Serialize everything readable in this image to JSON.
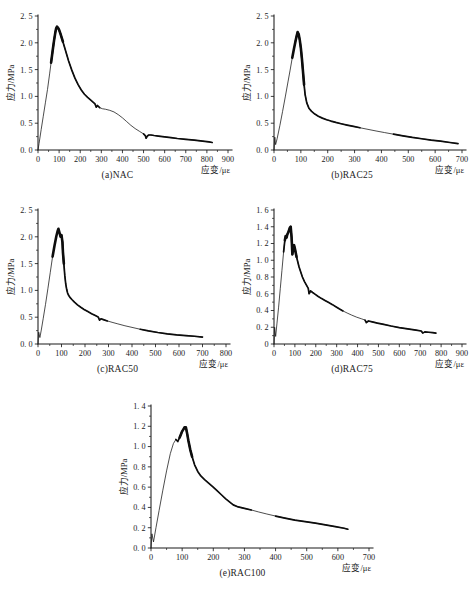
{
  "figure": {
    "axis_labels": {
      "y": "应力/MPa",
      "x": "应变/με"
    }
  },
  "panels": [
    {
      "id": "nac",
      "caption": "(a)NAC",
      "x_ticks": [
        "0",
        "100",
        "200",
        "300",
        "400",
        "500",
        "600",
        "700",
        "800",
        "900"
      ],
      "y_ticks": [
        "0. 0",
        "0. 5",
        "1. 0",
        "1. 5",
        "2. 0",
        "2. 5"
      ],
      "ylabel": "应力/MPa",
      "xlabel": "应变/με"
    },
    {
      "id": "rac25",
      "caption": "(b)RAC25",
      "x_ticks": [
        "0",
        "100",
        "200",
        "300",
        "400",
        "500",
        "600",
        "700"
      ],
      "y_ticks": [
        "0. 0",
        "0. 5",
        "1. 0",
        "1. 5",
        "2. 0",
        "2. 5"
      ],
      "ylabel": "应力/MPa",
      "xlabel": "应变/με"
    },
    {
      "id": "rac50",
      "caption": "(c)RAC50",
      "x_ticks": [
        "0",
        "100",
        "200",
        "300",
        "400",
        "500",
        "600",
        "700",
        "800"
      ],
      "y_ticks": [
        "0. 0",
        "0. 5",
        "1. 0",
        "1. 5",
        "2. 0",
        "2. 5"
      ],
      "ylabel": "应力/MPa",
      "xlabel": "应变/με"
    },
    {
      "id": "rac75",
      "caption": "(d)RAC75",
      "x_ticks": [
        "0",
        "100",
        "200",
        "300",
        "400",
        "500",
        "600",
        "700",
        "800",
        "900"
      ],
      "y_ticks": [
        "0",
        "0. 2",
        "0. 4",
        "0. 6",
        "0. 8",
        "1. 0",
        "1. 2",
        "1. 4",
        "1. 6"
      ],
      "ylabel": "应力/MPa",
      "xlabel": "应变/με"
    },
    {
      "id": "rac100",
      "caption": "(e)RAC100",
      "x_ticks": [
        "0",
        "100",
        "200",
        "300",
        "400",
        "500",
        "600",
        "700"
      ],
      "y_ticks": [
        "0. 0",
        "0. 2",
        "0. 4",
        "0. 6",
        "0. 8",
        "1. 0",
        "1. 2",
        "1. 4"
      ],
      "ylabel": "应力/MPa",
      "xlabel": "应变/με"
    }
  ],
  "chart_data": [
    {
      "type": "line",
      "id": "nac",
      "title": "(a)NAC",
      "xlabel": "应变/με",
      "ylabel": "应力/MPa",
      "xlim": [
        0,
        900
      ],
      "ylim": [
        0,
        2.5
      ],
      "xtick_step": 100,
      "ytick_step": 0.5,
      "grid": false,
      "legend": "none",
      "peak": {
        "x": 88,
        "y": 2.3
      },
      "series": [
        {
          "name": "NAC stress-strain",
          "x": [
            0,
            5,
            15,
            25,
            35,
            45,
            55,
            62,
            70,
            76,
            82,
            86,
            90,
            95,
            100,
            108,
            118,
            130,
            145,
            160,
            175,
            190,
            205,
            220,
            235,
            250,
            262,
            270,
            276,
            282,
            292,
            305,
            320,
            340,
            360,
            380,
            400,
            420,
            440,
            460,
            480,
            500,
            508,
            512,
            518,
            525,
            535,
            550,
            570,
            600,
            630,
            660,
            700,
            740,
            780,
            810,
            825
          ],
          "y": [
            0.0,
            0.12,
            0.38,
            0.63,
            0.88,
            1.13,
            1.42,
            1.63,
            1.87,
            2.04,
            2.19,
            2.27,
            2.3,
            2.28,
            2.24,
            2.15,
            2.02,
            1.86,
            1.66,
            1.49,
            1.34,
            1.22,
            1.12,
            1.04,
            0.98,
            0.93,
            0.89,
            0.86,
            0.8,
            0.83,
            0.79,
            0.77,
            0.76,
            0.74,
            0.71,
            0.66,
            0.6,
            0.53,
            0.46,
            0.4,
            0.35,
            0.3,
            0.27,
            0.22,
            0.26,
            0.28,
            0.28,
            0.27,
            0.26,
            0.245,
            0.23,
            0.215,
            0.2,
            0.185,
            0.165,
            0.15,
            0.14
          ]
        }
      ]
    },
    {
      "type": "line",
      "id": "rac25",
      "title": "(b)RAC25",
      "xlabel": "应变/με",
      "ylabel": "应力/MPa",
      "xlim": [
        0,
        700
      ],
      "ylim": [
        0,
        2.5
      ],
      "xtick_step": 100,
      "ytick_step": 0.5,
      "grid": false,
      "legend": "none",
      "peak": {
        "x": 88,
        "y": 2.2
      },
      "series": [
        {
          "name": "RAC25 stress-strain",
          "x": [
            0,
            3,
            6,
            12,
            22,
            32,
            42,
            52,
            60,
            68,
            74,
            80,
            84,
            88,
            92,
            96,
            100,
            104,
            108,
            112,
            116,
            122,
            130,
            140,
            152,
            165,
            180,
            196,
            212,
            230,
            250,
            272,
            296,
            320,
            350,
            380,
            412,
            445,
            480,
            515,
            550,
            585,
            620,
            655,
            685
          ],
          "y": [
            0.0,
            0.24,
            0.1,
            0.22,
            0.46,
            0.72,
            0.99,
            1.27,
            1.49,
            1.72,
            1.88,
            2.03,
            2.12,
            2.2,
            2.16,
            2.05,
            1.9,
            1.7,
            1.46,
            1.22,
            1.03,
            0.88,
            0.78,
            0.72,
            0.67,
            0.63,
            0.595,
            0.565,
            0.54,
            0.515,
            0.49,
            0.465,
            0.44,
            0.415,
            0.385,
            0.355,
            0.325,
            0.295,
            0.265,
            0.235,
            0.21,
            0.185,
            0.165,
            0.14,
            0.12
          ]
        }
      ]
    },
    {
      "type": "line",
      "id": "rac50",
      "title": "(c)RAC50",
      "xlabel": "应变/με",
      "ylabel": "应力/MPa",
      "xlim": [
        0,
        800
      ],
      "ylim": [
        0,
        2.5
      ],
      "xtick_step": 100,
      "ytick_step": 0.5,
      "grid": false,
      "legend": "none",
      "peak": {
        "x": 85,
        "y": 2.15
      },
      "series": [
        {
          "name": "RAC50 stress-strain",
          "x": [
            0,
            3,
            8,
            14,
            22,
            32,
            42,
            52,
            62,
            70,
            78,
            83,
            87,
            92,
            96,
            100,
            104,
            106,
            110,
            114,
            118,
            122,
            126,
            130,
            136,
            144,
            155,
            168,
            182,
            196,
            212,
            228,
            244,
            256,
            262,
            268,
            278,
            295,
            315,
            340,
            370,
            400,
            435,
            470,
            510,
            550,
            590,
            630,
            665,
            700
          ],
          "y": [
            0.0,
            0.22,
            0.12,
            0.26,
            0.47,
            0.74,
            1.03,
            1.33,
            1.63,
            1.83,
            2.01,
            2.1,
            2.15,
            2.07,
            2.0,
            2.03,
            1.9,
            1.72,
            1.5,
            1.28,
            1.12,
            1.02,
            0.95,
            0.91,
            0.87,
            0.83,
            0.78,
            0.73,
            0.685,
            0.645,
            0.605,
            0.565,
            0.53,
            0.505,
            0.445,
            0.47,
            0.455,
            0.43,
            0.405,
            0.375,
            0.34,
            0.31,
            0.275,
            0.245,
            0.215,
            0.19,
            0.17,
            0.155,
            0.145,
            0.13
          ]
        }
      ]
    },
    {
      "type": "line",
      "id": "rac75",
      "title": "(d)RAC75",
      "xlabel": "应变/με",
      "ylabel": "应力/MPa",
      "xlim": [
        0,
        900
      ],
      "ylim": [
        0,
        1.6
      ],
      "xtick_step": 100,
      "ytick_step": 0.2,
      "grid": false,
      "legend": "none",
      "peak": {
        "x": 78,
        "y": 1.4
      },
      "series": [
        {
          "name": "RAC75 stress-strain",
          "x": [
            0,
            3,
            8,
            14,
            22,
            30,
            38,
            46,
            52,
            56,
            60,
            64,
            68,
            72,
            76,
            80,
            84,
            88,
            92,
            96,
            100,
            104,
            108,
            114,
            120,
            128,
            136,
            146,
            156,
            164,
            168,
            175,
            185,
            196,
            210,
            226,
            244,
            262,
            280,
            296,
            312,
            330,
            350,
            372,
            396,
            420,
            436,
            442,
            452,
            470,
            495,
            525,
            560,
            600,
            640,
            680,
            705,
            712,
            722,
            740,
            760,
            775
          ],
          "y": [
            0.0,
            0.2,
            0.09,
            0.24,
            0.44,
            0.66,
            0.88,
            1.1,
            1.24,
            1.29,
            1.27,
            1.31,
            1.33,
            1.36,
            1.39,
            1.4,
            1.28,
            1.07,
            1.15,
            1.18,
            1.14,
            1.09,
            1.04,
            0.98,
            0.92,
            0.86,
            0.8,
            0.745,
            0.7,
            0.665,
            0.6,
            0.635,
            0.615,
            0.595,
            0.57,
            0.545,
            0.52,
            0.495,
            0.47,
            0.445,
            0.42,
            0.395,
            0.37,
            0.345,
            0.32,
            0.3,
            0.285,
            0.255,
            0.275,
            0.265,
            0.25,
            0.235,
            0.215,
            0.195,
            0.18,
            0.165,
            0.155,
            0.13,
            0.145,
            0.14,
            0.135,
            0.13
          ]
        }
      ]
    },
    {
      "type": "line",
      "id": "rac100",
      "title": "(e)RAC100",
      "xlabel": "应变/με",
      "ylabel": "应力/MPa",
      "xlim": [
        0,
        700
      ],
      "ylim": [
        0,
        1.4
      ],
      "xtick_step": 100,
      "ytick_step": 0.2,
      "grid": false,
      "legend": "none",
      "peak": {
        "x": 112,
        "y": 1.19
      },
      "series": [
        {
          "name": "RAC100 stress-strain",
          "x": [
            0,
            3,
            8,
            16,
            26,
            38,
            50,
            62,
            72,
            80,
            86,
            92,
            96,
            100,
            104,
            108,
            112,
            116,
            120,
            126,
            132,
            140,
            150,
            160,
            172,
            185,
            198,
            212,
            226,
            240,
            252,
            264,
            280,
            300,
            322,
            346,
            372,
            400,
            430,
            462,
            495,
            528,
            560,
            592,
            620,
            632
          ],
          "y": [
            0.0,
            0.14,
            0.06,
            0.2,
            0.37,
            0.57,
            0.76,
            0.93,
            1.03,
            1.07,
            1.05,
            1.09,
            1.12,
            1.15,
            1.17,
            1.19,
            1.19,
            1.13,
            1.06,
            0.97,
            0.9,
            0.82,
            0.755,
            0.71,
            0.675,
            0.64,
            0.605,
            0.565,
            0.525,
            0.485,
            0.455,
            0.425,
            0.405,
            0.39,
            0.375,
            0.355,
            0.335,
            0.315,
            0.295,
            0.275,
            0.26,
            0.245,
            0.228,
            0.21,
            0.195,
            0.185
          ]
        }
      ]
    }
  ]
}
